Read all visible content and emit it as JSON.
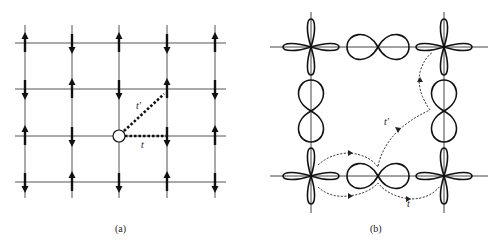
{
  "panel_a": {
    "caption": "(a)",
    "grid": {
      "columns_x": [
        25,
        72,
        119,
        167,
        215
      ],
      "rows_y": [
        43,
        89,
        136,
        182
      ],
      "x_range": [
        15,
        226
      ],
      "y_range": [
        25,
        198
      ]
    },
    "spins": [
      [
        "up",
        "down",
        "up",
        "down",
        "up"
      ],
      [
        "down",
        "up",
        "down",
        "up",
        "down"
      ],
      [
        "up",
        "down",
        "hole",
        "down",
        "up"
      ],
      [
        "down",
        "up",
        "down",
        "up",
        "down"
      ]
    ],
    "hole": {
      "x": 119,
      "y": 136,
      "r": 6
    },
    "hops": [
      {
        "name": "t",
        "label": "t",
        "from": [
          125,
          136
        ],
        "to": [
          167,
          136
        ],
        "label_pos": [
          141,
          148
        ]
      },
      {
        "name": "t-prime",
        "label": "t′",
        "from": [
          124,
          131
        ],
        "to": [
          164,
          94
        ],
        "label_pos": [
          136,
          109
        ]
      }
    ]
  },
  "panel_b": {
    "caption": "(b)",
    "axes": {
      "vertical_x": [
        311,
        444
      ],
      "horizontal_y": [
        47,
        176
      ],
      "x_range": [
        270,
        488
      ],
      "y_range": [
        12,
        213
      ]
    },
    "d_orbitals": [
      {
        "x": 311,
        "y": 47
      },
      {
        "x": 444,
        "y": 47
      },
      {
        "x": 311,
        "y": 176
      },
      {
        "x": 444,
        "y": 176
      }
    ],
    "p_orbitals": [
      {
        "x": 378,
        "y": 47,
        "orientation": "horizontal"
      },
      {
        "x": 378,
        "y": 176,
        "orientation": "horizontal"
      },
      {
        "x": 311,
        "y": 111,
        "orientation": "vertical"
      },
      {
        "x": 444,
        "y": 111,
        "orientation": "vertical"
      }
    ],
    "paths": {
      "t_label": "t",
      "t_label_pos": [
        407,
        207
      ],
      "t_prime_label": "t′",
      "t_prime_label_pos": [
        384,
        125
      ]
    }
  }
}
